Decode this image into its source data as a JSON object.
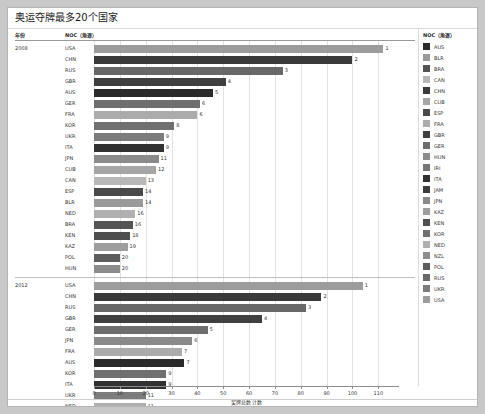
{
  "title": "奥运夺牌最多20个国家",
  "columns": {
    "year": "年份",
    "noc": "NOC（角逐）"
  },
  "axis": {
    "title": "奖牌总数 计数",
    "ticks": [
      0,
      10,
      20,
      30,
      40,
      50,
      60,
      70,
      80,
      90,
      100,
      110
    ],
    "min": 0,
    "max": 118
  },
  "legend": {
    "title": "NOC（角逐）",
    "items": [
      {
        "label": "AUS",
        "color": "#2b2b2b"
      },
      {
        "label": "BLR",
        "color": "#9a9a9a"
      },
      {
        "label": "BRA",
        "color": "#545454"
      },
      {
        "label": "CAN",
        "color": "#b8b8b8"
      },
      {
        "label": "CHN",
        "color": "#3a3a3a"
      },
      {
        "label": "CUB",
        "color": "#a6a6a6"
      },
      {
        "label": "ESP",
        "color": "#4a4a4a"
      },
      {
        "label": "FRA",
        "color": "#ababab"
      },
      {
        "label": "GBR",
        "color": "#3f3f3f"
      },
      {
        "label": "GER",
        "color": "#6e6e6e"
      },
      {
        "label": "HUN",
        "color": "#8c8c8c"
      },
      {
        "label": "IRI",
        "color": "#777777"
      },
      {
        "label": "ITA",
        "color": "#313131"
      },
      {
        "label": "JAM",
        "color": "#3d3d3d"
      },
      {
        "label": "JPN",
        "color": "#8a8a8a"
      },
      {
        "label": "KAZ",
        "color": "#9e9e9e"
      },
      {
        "label": "KEN",
        "color": "#4f4f4f"
      },
      {
        "label": "KOR",
        "color": "#707070"
      },
      {
        "label": "NED",
        "color": "#b0b0b0"
      },
      {
        "label": "NZL",
        "color": "#8e8e8e"
      },
      {
        "label": "POL",
        "color": "#5c5c5c"
      },
      {
        "label": "RUS",
        "color": "#686868"
      },
      {
        "label": "UKR",
        "color": "#7c7c7c"
      },
      {
        "label": "USA",
        "color": "#9c9c9c"
      }
    ]
  },
  "chart_data": {
    "type": "bar",
    "title": "奥运夺牌最多20个国家",
    "xlabel": "奖牌总数 计数",
    "ylabel": "NOC（角逐）",
    "xlim": [
      0,
      118
    ],
    "grid": true,
    "legend_position": "right",
    "panels": [
      {
        "year": "2008",
        "categories": [
          "USA",
          "CHN",
          "RUS",
          "GBR",
          "AUS",
          "GER",
          "FRA",
          "KOR",
          "UKR",
          "ITA",
          "JPN",
          "CUB",
          "CAN",
          "ESP",
          "BLR",
          "NED",
          "BRA",
          "KEN",
          "KAZ",
          "POL",
          "HUN"
        ],
        "values": [
          112,
          100,
          73,
          51,
          46,
          41,
          40,
          31,
          27,
          27,
          25,
          24,
          20,
          19,
          19,
          16,
          15,
          14,
          13,
          10,
          10
        ],
        "ranks": [
          "1",
          "2",
          "3",
          "4",
          "5",
          "6",
          "6",
          "8",
          "9",
          "9",
          "11",
          "12",
          "13",
          "14",
          "14",
          "16",
          "16",
          "18",
          "19",
          "20",
          "20"
        ],
        "colors": [
          "#9c9c9c",
          "#3a3a3a",
          "#686868",
          "#3f3f3f",
          "#2b2b2b",
          "#6e6e6e",
          "#ababab",
          "#707070",
          "#7c7c7c",
          "#313131",
          "#8a8a8a",
          "#a6a6a6",
          "#b8b8b8",
          "#4a4a4a",
          "#9a9a9a",
          "#b0b0b0",
          "#545454",
          "#4f4f4f",
          "#9e9e9e",
          "#5c5c5c",
          "#8c8c8c"
        ]
      },
      {
        "year": "2012",
        "categories": [
          "USA",
          "CHN",
          "RUS",
          "GBR",
          "GER",
          "JPN",
          "FRA",
          "AUS",
          "KOR",
          "ITA",
          "UKR",
          "NED",
          "HUN",
          "CAN",
          "ESP",
          "BRA",
          "CUB",
          "NZL",
          "KAZ",
          "JAM",
          "IRI",
          "BLR"
        ],
        "values": [
          104,
          88,
          82,
          65,
          44,
          38,
          34,
          35,
          28,
          28,
          20,
          20,
          17,
          18,
          17,
          17,
          14,
          13,
          13,
          12,
          12,
          12
        ],
        "ranks": [
          "1",
          "2",
          "3",
          "4",
          "5",
          "6",
          "7",
          "7",
          "9",
          "9",
          "11",
          "11",
          "13",
          "13",
          "16",
          "16",
          "17",
          "18",
          "18",
          "20",
          "20",
          "20"
        ],
        "colors": [
          "#9c9c9c",
          "#3a3a3a",
          "#686868",
          "#3f3f3f",
          "#6e6e6e",
          "#8a8a8a",
          "#ababab",
          "#2b2b2b",
          "#707070",
          "#313131",
          "#7c7c7c",
          "#b0b0b0",
          "#8c8c8c",
          "#b8b8b8",
          "#4a4a4a",
          "#545454",
          "#a6a6a6",
          "#8e8e8e",
          "#9e9e9e",
          "#3d3d3d",
          "#777777",
          "#9a9a9a"
        ]
      }
    ]
  }
}
